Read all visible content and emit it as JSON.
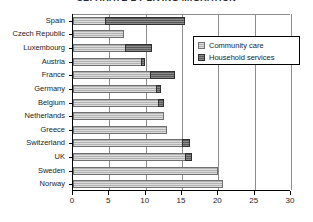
{
  "chart_data": {
    "type": "bar",
    "orientation": "horizontal",
    "stacked": true,
    "title": "SEPARATE BY LIVING MIGRATION",
    "xlabel": "",
    "ylabel": "",
    "xlim": [
      0,
      30
    ],
    "xticks": [
      0,
      5,
      10,
      15,
      20,
      25,
      30
    ],
    "xtick_labels": [
      "0",
      "5",
      "10",
      "15",
      "20",
      "25",
      "30"
    ],
    "grid": true,
    "grid_axis": "x",
    "legend_position": "top-right-inside",
    "categories": [
      "Spain",
      "Czech Republic",
      "Luxembourg",
      "Austria",
      "France",
      "Germany",
      "Belgium",
      "Netherlands",
      "Greece",
      "Switzerland",
      "UK",
      "Sweden",
      "Norway"
    ],
    "series": [
      {
        "name": "Community care",
        "color": "#b2b2b2",
        "values": [
          4.5,
          7.0,
          7.3,
          9.5,
          10.7,
          11.5,
          11.8,
          12.5,
          13.0,
          15.2,
          15.6,
          20.0,
          20.6
        ]
      },
      {
        "name": "Household services",
        "color": "#595959",
        "values": [
          11.0,
          0.0,
          3.7,
          0.5,
          3.5,
          0.8,
          0.8,
          0.0,
          0.0,
          1.0,
          0.9,
          0.0,
          0.0
        ]
      }
    ],
    "totals": [
      15.5,
      7.0,
      11.0,
      10.0,
      14.2,
      12.3,
      12.6,
      12.5,
      13.0,
      16.2,
      16.5,
      20.0,
      20.6
    ]
  },
  "legend": {
    "items": [
      {
        "label": "Community care",
        "swatch": "community"
      },
      {
        "label": "Household services",
        "swatch": "household"
      }
    ]
  }
}
